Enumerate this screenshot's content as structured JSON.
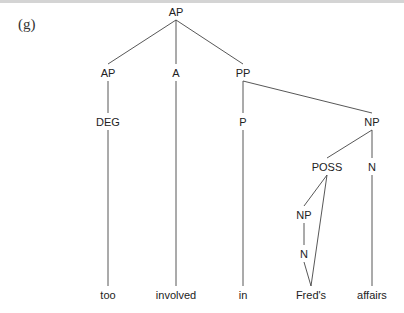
{
  "example_label": "(g)",
  "tree": {
    "nodes": [
      {
        "id": "root",
        "label": "AP",
        "x": 176,
        "y": 12
      },
      {
        "id": "ap2",
        "label": "AP",
        "x": 108,
        "y": 73
      },
      {
        "id": "a",
        "label": "A",
        "x": 176,
        "y": 73
      },
      {
        "id": "pp",
        "label": "PP",
        "x": 243,
        "y": 73
      },
      {
        "id": "deg",
        "label": "DEG",
        "x": 108,
        "y": 122
      },
      {
        "id": "p",
        "label": "P",
        "x": 243,
        "y": 122
      },
      {
        "id": "np",
        "label": "NP",
        "x": 372,
        "y": 122
      },
      {
        "id": "poss",
        "label": "POSS",
        "x": 327,
        "y": 167
      },
      {
        "id": "n1",
        "label": "N",
        "x": 372,
        "y": 167
      },
      {
        "id": "np2",
        "label": "NP",
        "x": 304,
        "y": 215
      },
      {
        "id": "n2",
        "label": "N",
        "x": 304,
        "y": 254
      },
      {
        "id": "w1",
        "label": "too",
        "x": 108,
        "y": 295
      },
      {
        "id": "w2",
        "label": "involved",
        "x": 176,
        "y": 295
      },
      {
        "id": "w3",
        "label": "in",
        "x": 243,
        "y": 295
      },
      {
        "id": "w4",
        "label": "Fred's",
        "x": 311,
        "y": 295
      },
      {
        "id": "w5",
        "label": "affairs",
        "x": 372,
        "y": 295
      }
    ],
    "edges": [
      [
        "root",
        "ap2"
      ],
      [
        "root",
        "a"
      ],
      [
        "root",
        "pp"
      ],
      [
        "ap2",
        "deg"
      ],
      [
        "deg",
        "w1"
      ],
      [
        "a",
        "w2"
      ],
      [
        "pp",
        "p"
      ],
      [
        "pp",
        "np"
      ],
      [
        "p",
        "w3"
      ],
      [
        "np",
        "poss"
      ],
      [
        "np",
        "n1"
      ],
      [
        "poss",
        "np2"
      ],
      [
        "poss",
        "w4"
      ],
      [
        "np2",
        "n2"
      ],
      [
        "n2",
        "w4"
      ],
      [
        "n1",
        "w5"
      ]
    ]
  }
}
